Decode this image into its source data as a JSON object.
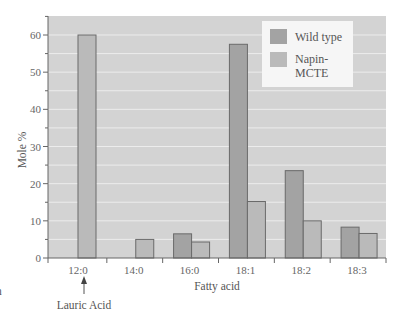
{
  "chart_data": {
    "type": "bar",
    "title": "",
    "xlabel": "Fatty acid",
    "ylabel": "Mole %",
    "ylim": [
      0,
      65
    ],
    "yticks": [
      0,
      10,
      20,
      30,
      40,
      50,
      60
    ],
    "grid": true,
    "legend_position": "upper right",
    "categories": [
      "12:0",
      "14:0",
      "16:0",
      "18:1",
      "18:2",
      "18:3"
    ],
    "series": [
      {
        "name": "Wild type",
        "color": "#a3a3a3",
        "values": [
          0,
          0,
          6.5,
          57.5,
          23.5,
          8.3
        ]
      },
      {
        "name": "Napin-MCTE",
        "color": "#bababa",
        "values": [
          60,
          5,
          4.3,
          15.2,
          10,
          6.6
        ]
      }
    ],
    "annotations": [
      {
        "text": "Lauric Acid",
        "target_category": "12:0",
        "arrow": "up"
      }
    ]
  },
  "legend": {
    "items": [
      {
        "label_line1": "Wild type",
        "label_line2": ""
      },
      {
        "label_line1": "Napin-",
        "label_line2": "MCTE"
      }
    ]
  },
  "annotation": {
    "text": "Lauric Acid"
  },
  "edge_fragment": {
    "text": "n"
  },
  "colors": {
    "plot_bg": "#d3d3d3",
    "gridline": "#ececec",
    "wild_type": "#a3a3a3",
    "napin_mcte": "#bababa",
    "bar_edge": "#6a6a6a",
    "axis": "#666666",
    "legend_bg": "#f6f6f6"
  }
}
